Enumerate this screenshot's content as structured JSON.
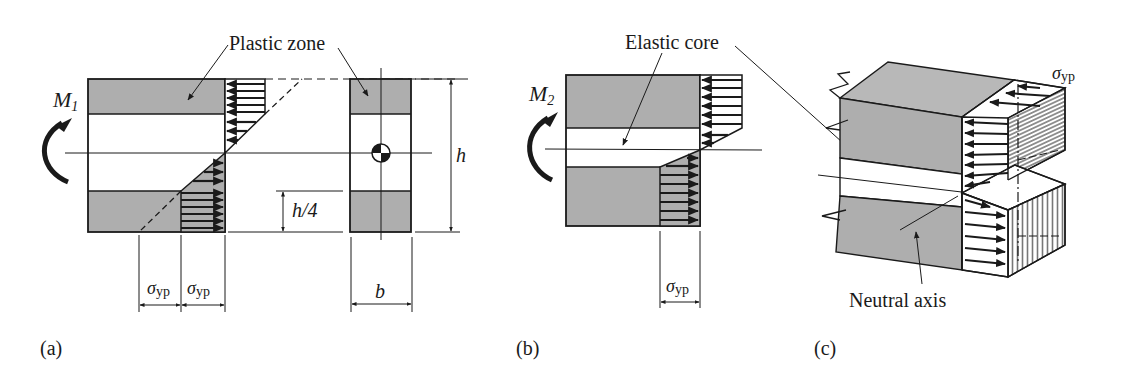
{
  "figure": {
    "colors": {
      "plastic_fill": "#aeaeae",
      "line": "#1a1a1a",
      "background": "#ffffff"
    },
    "panels": [
      {
        "id": "a",
        "caption": "(a)",
        "moment_label": "M",
        "moment_subscript": "1",
        "callout": "Plastic zone",
        "stress_label_left": "σ",
        "stress_label_left_sub": "yp",
        "stress_label_right": "σ",
        "stress_label_right_sub": "yp",
        "height_label": "h",
        "plastic_depth_label": "h/4",
        "width_label": "b"
      },
      {
        "id": "b",
        "caption": "(b)",
        "moment_label": "M",
        "moment_subscript": "2",
        "callout": "Elastic core",
        "stress_label": "σ",
        "stress_label_sub": "yp"
      },
      {
        "id": "c",
        "caption": "(c)",
        "stress_label": "σ",
        "stress_label_sub": "yp",
        "callout": "Neutral axis"
      }
    ]
  }
}
